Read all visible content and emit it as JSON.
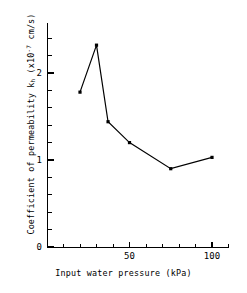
{
  "chart_data": {
    "type": "line",
    "title": "",
    "subtitle": "",
    "xlabel_parts": {
      "text": "Input water pressure (kPa)"
    },
    "ylabel_parts": {
      "prefix": "Coefficient of permeability k",
      "subscript": "h",
      "middle": " (x10",
      "superscript": "-7",
      "suffix": " cm/s)"
    },
    "xlabel": "Input water pressure (kPa)",
    "ylabel": "Coefficient of permeability kh (x10-7 cm/s)",
    "x": [
      20,
      30,
      37,
      50,
      75,
      100
    ],
    "values": [
      1.78,
      2.32,
      1.44,
      1.2,
      0.9,
      1.03
    ],
    "series": [
      {
        "name": "Coefficient of permeability",
        "x": [
          20,
          30,
          37,
          50,
          75,
          100
        ],
        "values": [
          1.78,
          2.32,
          1.44,
          1.2,
          0.9,
          1.03
        ]
      }
    ],
    "xlim": [
      0,
      110
    ],
    "ylim": [
      0,
      2.5
    ],
    "x_major_ticks": [
      50,
      100
    ],
    "x_major_tick_labels": [
      "50",
      "100"
    ],
    "x_minor_ticks": [
      10,
      20,
      30,
      40,
      60,
      70,
      80,
      90,
      110
    ],
    "y_major_ticks": [
      0,
      1,
      2
    ],
    "y_major_tick_labels": [
      "0",
      "1",
      "2"
    ],
    "y_minor_ticks": [
      0.2,
      0.4,
      0.6,
      0.8,
      1.2,
      1.4,
      1.6,
      1.8,
      2.2,
      2.4
    ],
    "grid": false,
    "legend": null,
    "marker": "square",
    "marker_color": "#000000",
    "line_color": "#000000",
    "background_color": "#ffffff",
    "axis_color": "#000000"
  }
}
